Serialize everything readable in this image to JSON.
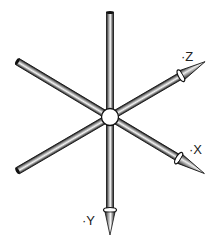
{
  "diagram": {
    "type": "3d-coordinate-axes-illustration",
    "center": {
      "x": 110,
      "y": 117
    },
    "axes": [
      {
        "id": "z",
        "label": "·Z",
        "direction": "upper-right"
      },
      {
        "id": "x",
        "label": "·X",
        "direction": "lower-right"
      },
      {
        "id": "y",
        "label": "·Y",
        "direction": "down"
      }
    ],
    "colors": {
      "rod_dark": "#1a1a1a",
      "rod_mid": "#8a8a8a",
      "rod_light": "#f2f2f2",
      "background": "#ffffff"
    }
  }
}
